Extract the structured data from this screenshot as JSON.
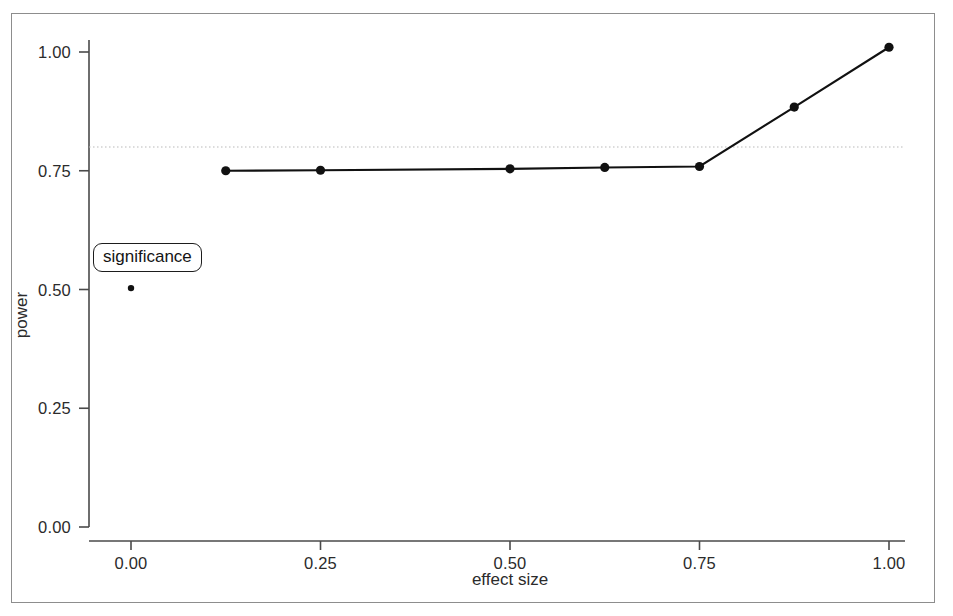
{
  "figure": {
    "background_color": "#ffffff",
    "frame_color": "#8d8d8d",
    "annotation": {
      "text": "significance",
      "name": "significance-callout"
    }
  },
  "chart_data": {
    "type": "line",
    "title": "",
    "xlabel": "effect size",
    "ylabel": "power",
    "xlim": [
      -0.04,
      1.04
    ],
    "ylim": [
      -0.04,
      1.04
    ],
    "xticks": [
      0.0,
      0.25,
      0.5,
      0.75,
      1.0
    ],
    "xticklabels": [
      "0.00",
      "0.25",
      "0.50",
      "0.75",
      "1.00"
    ],
    "yticks": [
      0.0,
      0.25,
      0.5,
      0.75,
      1.0
    ],
    "yticklabels": [
      "0.00",
      "0.25",
      "0.50",
      "0.75",
      "1.00"
    ],
    "grid": false,
    "legend": "none",
    "series": [
      {
        "name": "power curve",
        "marker": "filled-circle",
        "color": "#111111",
        "line": "solid",
        "x": [
          0.125,
          0.25,
          0.5,
          0.625,
          0.75,
          0.875,
          1.0
        ],
        "y": [
          0.75,
          0.751,
          0.754,
          0.757,
          0.759,
          0.884,
          1.01
        ]
      },
      {
        "name": "significance point",
        "marker": "filled-circle",
        "color": "#111111",
        "line": "none",
        "x": [
          0.0
        ],
        "y": [
          0.503
        ]
      }
    ],
    "reference_lines": [
      {
        "name": "power-threshold",
        "orientation": "horizontal",
        "value": 0.8,
        "style": "dotted",
        "color": "#b9b9b9"
      }
    ]
  }
}
